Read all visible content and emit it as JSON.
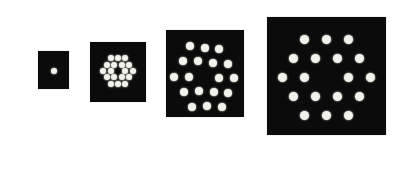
{
  "figure": {
    "panels": [
      {
        "id": "panel-1",
        "pattern": "single-dot",
        "dot_count": 1,
        "caption": ""
      },
      {
        "id": "panel-2",
        "pattern": "hexagonal-cluster-center-missing",
        "dot_count": 18,
        "caption": ""
      },
      {
        "id": "panel-3",
        "pattern": "hexagonal-ring-array",
        "dot_count": 18,
        "caption": ""
      },
      {
        "id": "panel-4",
        "pattern": "hexagonal-ring-array",
        "dot_count": 18,
        "caption": ""
      }
    ],
    "colors": {
      "panel": "#0b0b0b",
      "dot": "#f2f2ec",
      "caption": "#b8b8b8",
      "background": "#ffffff"
    }
  }
}
